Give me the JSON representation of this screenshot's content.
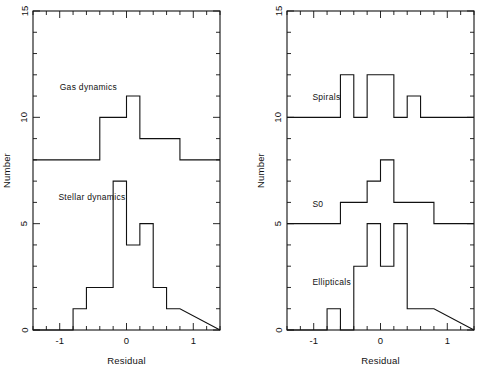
{
  "figure": {
    "background": "#ffffff",
    "line_color": "#111111",
    "panel_count": 2
  },
  "chart_data": [
    {
      "type": "line",
      "subtype": "step-histogram",
      "panel": "left",
      "title": "",
      "xlabel": "Residual",
      "ylabel": "Number",
      "xlim": [
        -1.4,
        1.4
      ],
      "ylim": [
        0,
        15
      ],
      "xticks": [
        -1,
        0,
        1
      ],
      "xticklabels": [
        "-1",
        "0",
        "1"
      ],
      "xtick_minor_step": 0.2,
      "yticks": [
        0,
        5,
        10,
        15
      ],
      "yticklabels": [
        "0",
        "5",
        "10",
        "15"
      ],
      "ytick_minor_step": 1,
      "grid": false,
      "legend": "inline-annotation",
      "bin_width": 0.2,
      "series": [
        {
          "name": "Gas dynamics",
          "label_x": -1.0,
          "label_y": 11.3,
          "baseline": 8,
          "bin_edges": [
            -1.2,
            -1.0,
            -0.8,
            -0.6,
            -0.4,
            -0.2,
            0.0,
            0.2,
            0.4,
            0.6,
            0.8,
            1.0,
            1.2
          ],
          "values": [
            8,
            8,
            8,
            8,
            10,
            10,
            11,
            9,
            9,
            9,
            8,
            8
          ]
        },
        {
          "name": "Stellar dynamics",
          "label_x": -1.02,
          "label_y": 6.1,
          "baseline": 0,
          "bin_edges": [
            -0.8,
            -0.6,
            -0.4,
            -0.2,
            0.0,
            0.2,
            0.4,
            0.6,
            0.8
          ],
          "values": [
            1,
            2,
            2,
            7,
            4,
            5,
            2,
            1
          ]
        }
      ]
    },
    {
      "type": "line",
      "subtype": "step-histogram",
      "panel": "right",
      "title": "",
      "xlabel": "Residual",
      "ylabel": "Number",
      "xlim": [
        -1.4,
        1.4
      ],
      "ylim": [
        0,
        15
      ],
      "xticks": [
        -1,
        0,
        1
      ],
      "xticklabels": [
        "-1",
        "0",
        "1"
      ],
      "xtick_minor_step": 0.2,
      "yticks": [
        0,
        5,
        10,
        15
      ],
      "yticklabels": [
        "0",
        "5",
        "10",
        "15"
      ],
      "ytick_minor_step": 1,
      "grid": false,
      "legend": "inline-annotation",
      "bin_width": 0.2,
      "series": [
        {
          "name": "Spirals",
          "label_x": -1.02,
          "label_y": 10.8,
          "baseline": 10,
          "bin_edges": [
            -1.2,
            -1.0,
            -0.8,
            -0.6,
            -0.4,
            -0.2,
            0.0,
            0.2,
            0.4,
            0.6,
            0.8,
            1.0,
            1.2
          ],
          "values": [
            10,
            10,
            10,
            12,
            10,
            12,
            12,
            10,
            11,
            10,
            10,
            10
          ]
        },
        {
          "name": "S0",
          "label_x": -1.02,
          "label_y": 5.8,
          "baseline": 5,
          "bin_edges": [
            -1.2,
            -1.0,
            -0.8,
            -0.6,
            -0.4,
            -0.2,
            0.0,
            0.2,
            0.4,
            0.6,
            0.8,
            1.0,
            1.2
          ],
          "values": [
            5,
            5,
            5,
            6,
            6,
            7,
            8,
            6,
            6,
            6,
            5,
            5
          ]
        },
        {
          "name": "Ellipticals",
          "label_x": -1.02,
          "label_y": 2.1,
          "baseline": 0,
          "bin_edges": [
            -0.8,
            -0.6,
            -0.4,
            -0.2,
            0.0,
            0.2,
            0.4,
            0.6,
            0.8
          ],
          "values": [
            1,
            0,
            3,
            5,
            3,
            5,
            1,
            1
          ]
        }
      ]
    }
  ]
}
